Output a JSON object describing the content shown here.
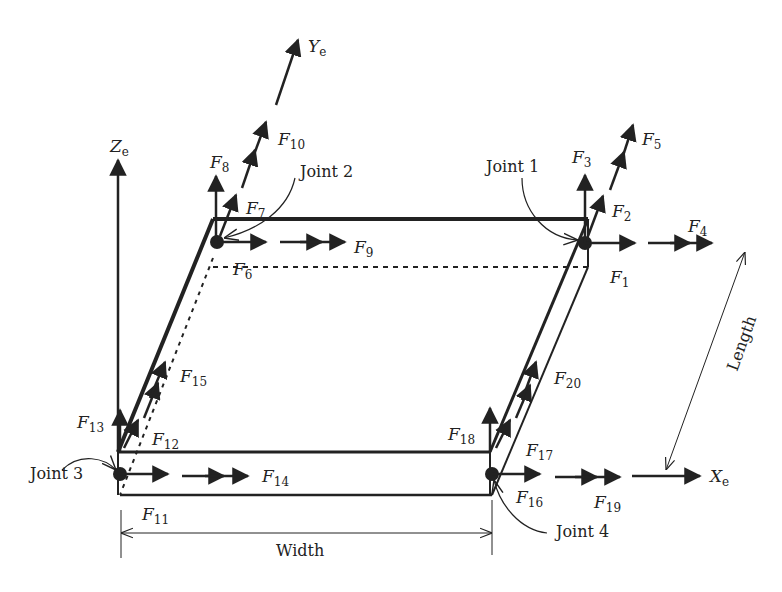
{
  "diagram": {
    "axes": {
      "x": {
        "letter": "X",
        "sub": "e"
      },
      "y": {
        "letter": "Y",
        "sub": "e"
      },
      "z": {
        "letter": "Z",
        "sub": "e"
      }
    },
    "joints": [
      {
        "id": 1,
        "label": "Joint 1"
      },
      {
        "id": 2,
        "label": "Joint 2"
      },
      {
        "id": 3,
        "label": "Joint 3"
      },
      {
        "id": 4,
        "label": "Joint 4"
      }
    ],
    "forces": {
      "f1": "1",
      "f2": "2",
      "f3": "3",
      "f4": "4",
      "f5": "5",
      "f6": "6",
      "f7": "7",
      "f8": "8",
      "f9": "9",
      "f10": "10",
      "f11": "11",
      "f12": "12",
      "f13": "13",
      "f14": "14",
      "f15": "15",
      "f16": "16",
      "f17": "17",
      "f18": "18",
      "f19": "19",
      "f20": "20"
    },
    "force_letter": "F",
    "dimensions": {
      "width": "Width",
      "length": "Length"
    }
  }
}
